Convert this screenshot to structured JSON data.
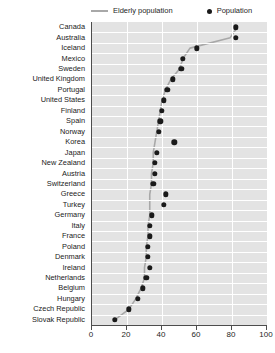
{
  "legend": {
    "items": [
      {
        "label": "Elderly population",
        "marker": "line",
        "color": "#a8a8a8"
      },
      {
        "label": "Population",
        "marker": "dot",
        "color": "#1a1a1a"
      }
    ]
  },
  "colors": {
    "plot_background": "#e3e3e3",
    "gridline": "#ffffff",
    "axis": "#4d4d4d",
    "dot": "#1a1a1a",
    "line": "#a8a8a8",
    "text": "#1a1a1a"
  },
  "chart_data": {
    "type": "scatter",
    "title": "",
    "xlabel": "",
    "ylabel": "",
    "xlim": [
      0,
      100
    ],
    "xticks": [
      0,
      20,
      40,
      60,
      80,
      100
    ],
    "grid": true,
    "legend_position": "top",
    "orientation": "horizontal",
    "categories": [
      "Canada",
      "Australia",
      "Iceland",
      "Mexico",
      "Sweden",
      "United Kingdom",
      "Portugal",
      "United States",
      "Finland",
      "Spain",
      "Norway",
      "Korea",
      "Japan",
      "New Zealand",
      "Austria",
      "Switzerland",
      "Greece",
      "Turkey",
      "Germany",
      "Italy",
      "France",
      "Poland",
      "Denmark",
      "Ireland",
      "Netherlands",
      "Belgium",
      "Hungary",
      "Czech Republic",
      "Slovak Republic"
    ],
    "series": [
      {
        "name": "Population",
        "marker": "dot",
        "values": [
          82,
          82,
          60,
          52,
          51,
          46,
          43,
          41,
          40,
          39,
          38,
          47,
          37,
          36,
          36,
          35,
          42,
          41,
          34,
          33,
          33,
          32,
          32,
          33,
          31,
          29,
          26,
          21,
          13
        ]
      },
      {
        "name": "Elderly population",
        "marker": "line",
        "values": [
          83,
          79,
          56,
          52,
          50,
          45,
          42,
          40,
          39,
          38,
          37,
          36,
          35,
          35,
          34,
          34,
          33,
          33,
          33,
          32,
          32,
          31,
          31,
          30,
          30,
          28,
          25,
          21,
          13
        ]
      }
    ]
  }
}
